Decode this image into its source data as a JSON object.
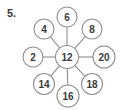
{
  "figure": {
    "problem_number": "5.",
    "type": "spider-web-number-diagram",
    "center": {
      "label": "12",
      "cx": 67,
      "cy": 57,
      "r": 11.5
    },
    "outer_nodes": [
      {
        "label": "6",
        "cx": 67,
        "cy": 17,
        "r": 10,
        "angle_deg": 90
      },
      {
        "label": "8",
        "cx": 92,
        "cy": 29,
        "r": 10,
        "angle_deg": 45
      },
      {
        "label": "20",
        "cx": 104,
        "cy": 57,
        "r": 11,
        "angle_deg": 0
      },
      {
        "label": "18",
        "cx": 92,
        "cy": 84,
        "r": 10.5,
        "angle_deg": -45
      },
      {
        "label": "16",
        "cx": 68,
        "cy": 96,
        "r": 11,
        "angle_deg": -90
      },
      {
        "label": "14",
        "cx": 44,
        "cy": 84,
        "r": 10.5,
        "angle_deg": -135
      },
      {
        "label": "2",
        "cx": 33,
        "cy": 57,
        "r": 10,
        "angle_deg": 180
      },
      {
        "label": "4",
        "cx": 44,
        "cy": 29,
        "r": 10,
        "angle_deg": 135
      }
    ],
    "colors": {
      "stroke": "#8e8e8e",
      "text": "#3a3a3a",
      "background": "#ffffff",
      "node_fill": "#ffffff"
    }
  }
}
